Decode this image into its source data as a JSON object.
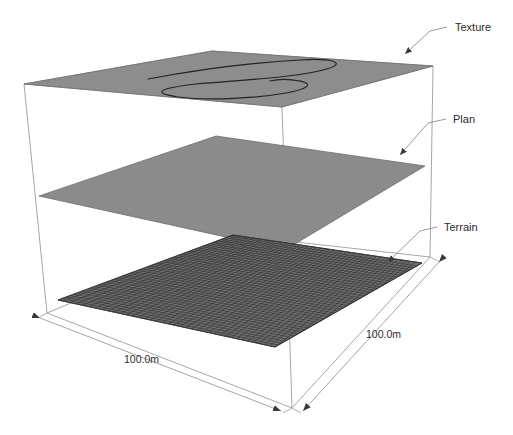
{
  "diagram": {
    "background_color": "#ffffff",
    "line_color": "#9a9a9a",
    "text_color": "#2b2b2b"
  },
  "labels": {
    "texture": "Texture",
    "plan": "Plan",
    "terrain": "Terrain"
  },
  "dimensions": {
    "width_label": "100.0m",
    "depth_label": "100.0m"
  },
  "layers": [
    {
      "name": "texture",
      "label": "Texture",
      "fill_color": "#8d8d8d",
      "stroke_color": "#6f6f6f",
      "content": "serpentine-curve",
      "curve_color": "#262626"
    },
    {
      "name": "plan",
      "label": "Plan",
      "fill_color": "#8b8b8b",
      "stroke_color": "#6f6f6f",
      "content": "plain"
    },
    {
      "name": "terrain",
      "label": "Terrain",
      "fill_color": "#6b6b6b",
      "stroke_color": "#3a3a3a",
      "content": "grid-mesh",
      "grid_color": "#2e2e2e",
      "grid_divisions": 44
    }
  ]
}
